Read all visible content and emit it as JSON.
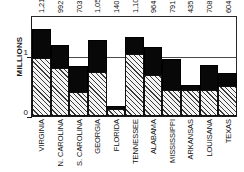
{
  "chart_data": {
    "type": "bar",
    "subtype": "stacked-bar",
    "title": "",
    "xlabel": "",
    "ylabel": "MILLIONS",
    "ylim": [
      0,
      1.4
    ],
    "ytick_labels": [
      "0",
      "1"
    ],
    "ytick_values": [
      0,
      1
    ],
    "grid": true,
    "legend": "none",
    "categories": [
      "VIRGINIA",
      "N. CAROLINA",
      "S. CAROLINA",
      "GEORGIA",
      "FLORIDA",
      "TENNESSEE",
      "ALABAMA",
      "MISSISSIPPI",
      "ARKANSAS",
      "LOUISANA",
      "TEXAS"
    ],
    "value_labels": [
      "1,219,630",
      "992,622",
      "703,708",
      "1,057,286",
      "140,424",
      "1,109,801",
      "964,201",
      "791,305",
      "435,450",
      "708,002",
      "604,215"
    ],
    "values": [
      1219630,
      992622,
      703708,
      1057286,
      140424,
      1109801,
      964201,
      791305,
      435450,
      708002,
      604215
    ],
    "series": [
      {
        "name": "lower-segment-hatched",
        "style": "hatched",
        "color": "#f2f2f2",
        "values": [
          816000,
          670000,
          330000,
          613000,
          95000,
          870000,
          576000,
          364000,
          360000,
          360000,
          425000
        ]
      },
      {
        "name": "upper-segment-solid",
        "style": "solid",
        "color": "#080808",
        "values": [
          403630,
          322622,
          373708,
          444286,
          45424,
          239801,
          388201,
          427305,
          75450,
          348002,
          179215
        ]
      }
    ]
  }
}
